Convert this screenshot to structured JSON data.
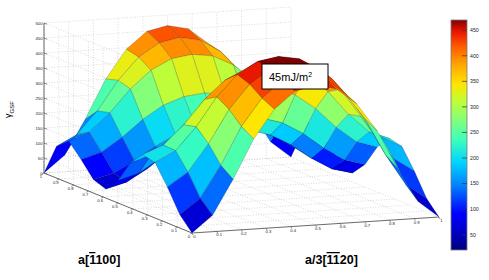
{
  "figure": {
    "background_color": "#ffffff",
    "plot_type": "surface3d",
    "annotation": {
      "text": "45mJ/m",
      "superscript": "2",
      "full": "45mJ/m²",
      "box_border_color": "#000000",
      "box_fill_color": "#ffffff"
    }
  },
  "axes": {
    "x": {
      "label_prefix": "a",
      "label_bracket_open": "[",
      "label_bar_digit": "1",
      "label_rest": "100",
      "label_bracket_close": "]",
      "label_full": "a[̄1100]",
      "ticks": [
        "1",
        "0.9",
        "0.8",
        "0.7",
        "0.6",
        "0.5",
        "0.4",
        "0.3",
        "0.2",
        "0.1",
        "0"
      ],
      "range": [
        0,
        1
      ],
      "direction": "descending-left-to-right"
    },
    "y": {
      "label_prefix": "a/3",
      "label_bracket_open": "[",
      "label_bar_digits": "11",
      "label_rest": "20",
      "label_bracket_close": "]",
      "label_full": "a/3[̄1̄1 20]",
      "ticks": [
        "0",
        "0.1",
        "0.2",
        "0.3",
        "0.4",
        "0.5",
        "0.6",
        "0.7",
        "0.8",
        "0.9",
        "1"
      ],
      "range": [
        0,
        1
      ],
      "direction": "ascending-left-to-right"
    },
    "z": {
      "label_main": "γ",
      "label_sub": "GSF",
      "label_full": "γGSF",
      "ticks": [
        "500",
        "450",
        "400",
        "350",
        "300",
        "250",
        "200",
        "150",
        "100",
        "50",
        "0"
      ],
      "range": [
        0,
        500
      ],
      "tick_step": 50
    },
    "grid": "dotted",
    "grid_color": "#b9b9b9",
    "pane_edge_color": "#555555"
  },
  "colorbar": {
    "ticks": [
      "450",
      "400",
      "350",
      "300",
      "250",
      "200",
      "150",
      "100",
      "50"
    ],
    "range": [
      20,
      470
    ],
    "colormap": "jet",
    "border_color": "#7a7a7a",
    "stops": [
      {
        "pos": 0.0,
        "color": "#00007f"
      },
      {
        "pos": 0.08,
        "color": "#0000c8"
      },
      {
        "pos": 0.16,
        "color": "#0000ff"
      },
      {
        "pos": 0.28,
        "color": "#0080ff"
      },
      {
        "pos": 0.38,
        "color": "#00d4ff"
      },
      {
        "pos": 0.48,
        "color": "#3dffba"
      },
      {
        "pos": 0.56,
        "color": "#7fff7f"
      },
      {
        "pos": 0.64,
        "color": "#baff3d"
      },
      {
        "pos": 0.72,
        "color": "#ffe500"
      },
      {
        "pos": 0.8,
        "color": "#ffab00"
      },
      {
        "pos": 0.88,
        "color": "#ff6000"
      },
      {
        "pos": 0.95,
        "color": "#e81600"
      },
      {
        "pos": 1.0,
        "color": "#7f0000"
      }
    ]
  },
  "chart_data": {
    "type": "surface",
    "title": "",
    "xlabel": "a[̄1100]",
    "ylabel": "a/3[̄1̄1 20]",
    "zlabel": "γGSF",
    "xlim": [
      0,
      1
    ],
    "ylim": [
      0,
      1
    ],
    "zlim": [
      0,
      500
    ],
    "colormap": "jet",
    "grid": true,
    "legend": "none",
    "annotations": [
      {
        "text": "45mJ/m²",
        "kind": "boxed-label"
      }
    ],
    "x": [
      0,
      0.0833,
      0.1667,
      0.25,
      0.3333,
      0.4167,
      0.5,
      0.5833,
      0.6667,
      0.75,
      0.8333,
      0.9167,
      1
    ],
    "y": [
      0,
      0.0833,
      0.1667,
      0.25,
      0.3333,
      0.4167,
      0.5,
      0.5833,
      0.6667,
      0.75,
      0.8333,
      0.9167,
      1
    ],
    "z_description": "Generalized stacking fault energy surface (gamma-surface) with two tall ridges near the x-extremes, a deep central valley / saddle, and a stable stacking-fault minimum of 45 mJ/m^2.",
    "z": [
      [
        0,
        55,
        170,
        300,
        395,
        450,
        465,
        450,
        395,
        300,
        170,
        55,
        0
      ],
      [
        45,
        95,
        200,
        325,
        415,
        468,
        482,
        468,
        415,
        325,
        200,
        95,
        45
      ],
      [
        120,
        165,
        255,
        365,
        445,
        492,
        505,
        492,
        445,
        365,
        255,
        165,
        120
      ],
      [
        185,
        220,
        295,
        390,
        460,
        500,
        512,
        500,
        460,
        390,
        295,
        220,
        185
      ],
      [
        195,
        222,
        285,
        365,
        425,
        458,
        468,
        458,
        425,
        365,
        285,
        222,
        195
      ],
      [
        150,
        172,
        225,
        292,
        342,
        370,
        378,
        370,
        342,
        292,
        225,
        172,
        150
      ],
      [
        75,
        95,
        138,
        192,
        232,
        252,
        258,
        252,
        232,
        192,
        138,
        95,
        75
      ],
      [
        30,
        48,
        88,
        138,
        175,
        195,
        200,
        195,
        175,
        138,
        88,
        48,
        30
      ],
      [
        45,
        62,
        98,
        142,
        176,
        195,
        200,
        195,
        176,
        142,
        98,
        62,
        45
      ],
      [
        95,
        115,
        160,
        215,
        258,
        282,
        290,
        282,
        258,
        215,
        160,
        115,
        95
      ],
      [
        140,
        165,
        225,
        300,
        358,
        392,
        402,
        392,
        358,
        300,
        225,
        165,
        140
      ],
      [
        105,
        140,
        215,
        312,
        385,
        428,
        442,
        428,
        385,
        312,
        215,
        140,
        105
      ],
      [
        0,
        55,
        170,
        300,
        395,
        450,
        465,
        450,
        395,
        300,
        170,
        55,
        0
      ]
    ],
    "features": [
      {
        "name": "left-ridge-peak",
        "approx_z": 512
      },
      {
        "name": "right-ridge-peak",
        "approx_z": 442
      },
      {
        "name": "front-secondary-peak",
        "approx_z": 420
      },
      {
        "name": "central-valley-min",
        "approx_z": 30
      },
      {
        "name": "stable-stacking-fault",
        "approx_z": 45,
        "label": "45mJ/m²"
      }
    ]
  }
}
